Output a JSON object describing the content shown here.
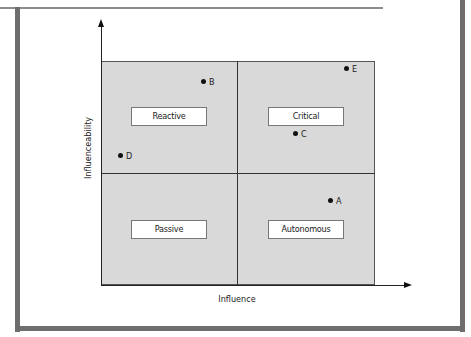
{
  "diagram": {
    "x_axis_label": "Influence",
    "y_axis_label": "Influenceability",
    "quadrants": [
      {
        "position": "top-left",
        "label": "Reactive"
      },
      {
        "position": "top-right",
        "label": "Critical"
      },
      {
        "position": "bottom-left",
        "label": "Passive"
      },
      {
        "position": "bottom-right",
        "label": "Autonomous"
      }
    ],
    "points": [
      {
        "label": "A",
        "quadrant": "Autonomous"
      },
      {
        "label": "B",
        "quadrant": "Reactive"
      },
      {
        "label": "C",
        "quadrant": "Critical"
      },
      {
        "label": "D",
        "quadrant": "Reactive"
      },
      {
        "label": "E",
        "quadrant": "Critical"
      }
    ],
    "colors": {
      "quadrant_fill": "#d9d9d9",
      "frame": "#6e6e6e",
      "label_box": "#ffffff"
    }
  }
}
